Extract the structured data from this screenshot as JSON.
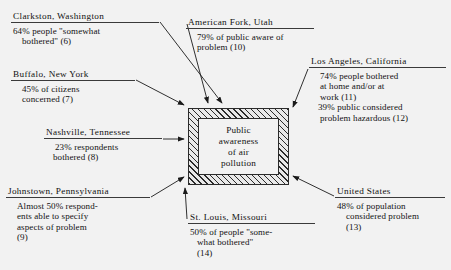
{
  "diagram": {
    "type": "influence-diagram",
    "center": {
      "name": "central-concept",
      "lines": [
        "Public",
        "awareness",
        "of air",
        "pollution"
      ],
      "text": "Public awareness of air pollution"
    },
    "callouts": [
      {
        "id": "clarkston",
        "heading": "Clarkston, Washington",
        "lines": [
          "64% people \"somewhat",
          "bothered\" (6)"
        ],
        "ref": "(6)",
        "value": "64%",
        "arrow_target": "box-top"
      },
      {
        "id": "buffalo",
        "heading": "Buffalo, New York",
        "lines": [
          "45% of citizens",
          "concerned (7)"
        ],
        "ref": "(7)",
        "value": "45%",
        "arrow_target": "box-top-left"
      },
      {
        "id": "nashville",
        "heading": "Nashville, Tennessee",
        "lines": [
          "23% respondents",
          "bothered (8)"
        ],
        "ref": "(8)",
        "value": "23%",
        "arrow_target": "box-left"
      },
      {
        "id": "johnstown",
        "heading": "Johnstown, Pennsylvania",
        "lines": [
          "Almost 50% respond-",
          "ents able to specify",
          "aspects of problem",
          "(9)"
        ],
        "ref": "(9)",
        "value": "Almost 50%",
        "arrow_target": "box-bottom-left"
      },
      {
        "id": "american-fork",
        "heading": "American Fork, Utah",
        "lines": [
          "79% of public aware of",
          "problem (10)"
        ],
        "ref": "(10)",
        "value": "79%",
        "arrow_target": "box-top"
      },
      {
        "id": "los-angeles",
        "heading": "Los Angeles, California",
        "lines": [
          "74% people bothered",
          "at home and/or at",
          "work (11)",
          "39% public considered",
          "problem hazardous (12)"
        ],
        "ref": "(11), (12)",
        "value": "74%, 39%",
        "arrow_target": "box-top-right"
      },
      {
        "id": "united-states",
        "heading": "United States",
        "lines": [
          "48% of population",
          "considered problem",
          "(13)"
        ],
        "ref": "(13)",
        "value": "48%",
        "arrow_target": "box-bottom-right"
      },
      {
        "id": "st-louis",
        "heading": "St. Louis, Missouri",
        "lines": [
          "50% of people \"some-",
          "what bothered\"",
          "(14)"
        ],
        "ref": "(14)",
        "value": "50%",
        "arrow_target": "box-bottom-left"
      }
    ],
    "colors": {
      "background": "#f2f2f2",
      "ink": "#1a1a1a",
      "hatch": "#2b2b2b",
      "rule": "#3a3a3a"
    }
  }
}
